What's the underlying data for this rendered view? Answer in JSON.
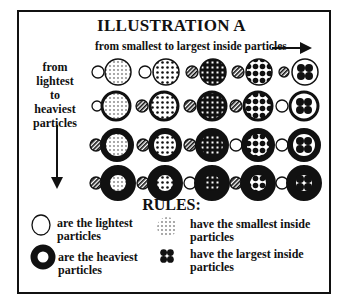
{
  "title": "ILLUSTRATION A",
  "x_axis_label": "from smallest to largest inside particles",
  "y_axis_label": [
    "from",
    "lightest",
    "to",
    "heaviest",
    "particles"
  ],
  "grid": {
    "rows": 4,
    "columns": 5,
    "row_meaning": "from lightest to heaviest particles (outer ring thickness increases downward)",
    "column_meaning": "from smallest to largest inside particles (inner dots grow rightward)"
  },
  "rules_title": "RULES:",
  "rules": [
    {
      "symbol": "thin-ring",
      "text_line1": "are the lightest",
      "text_line2": "particles"
    },
    {
      "symbol": "thick-ring",
      "text_line1": "are the heaviest",
      "text_line2": "particles"
    },
    {
      "symbol": "fine-dots",
      "text_line1": "have the smallest inside",
      "text_line2": "particles"
    },
    {
      "symbol": "four-large-dots",
      "text_line1": "have the largest inside",
      "text_line2": "particles"
    }
  ]
}
